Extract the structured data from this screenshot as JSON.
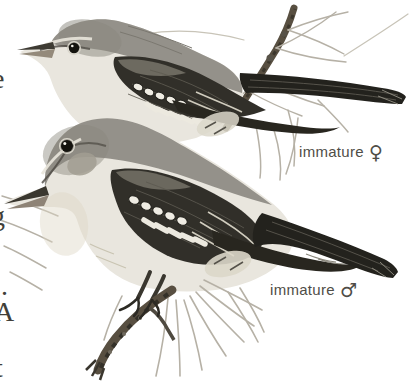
{
  "labels": {
    "female": {
      "text": "immature",
      "symbol": "♀"
    },
    "male": {
      "text": "immature",
      "symbol": "♂"
    }
  },
  "left_margin_fragments": [
    {
      "char": "-"
    },
    {
      "char": "e"
    },
    {
      "char": "g"
    },
    {
      "char": "-"
    },
    {
      "char": "."
    },
    {
      "char": "A"
    },
    {
      "char": "-"
    },
    {
      "char": "t"
    }
  ],
  "colors": {
    "background": "#ffffff",
    "label_text": "#4f4d47",
    "margin_text": "#413f39",
    "underparts_pale": "#e9e6de",
    "upperparts_gray": "#94918a",
    "wing_dark": "#312f29",
    "primaries_dark": "#28261f",
    "tail_dark": "#23221d",
    "wingbar_white": "#efece3",
    "needle_gray": "#b6b1a6",
    "twig_gray": "#584f41",
    "eye_black": "#14130e"
  }
}
